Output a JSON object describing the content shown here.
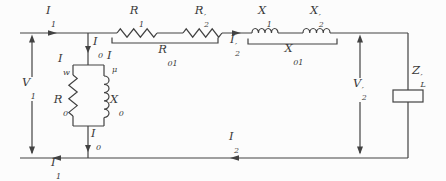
{
  "diagram": {
    "kind": "transformer-equivalent-circuit",
    "colors": {
      "background": "#fcfcfc",
      "stroke": "#424242",
      "text": "#3a3a3a"
    },
    "labels": {
      "i1_top": {
        "base": "I",
        "prime": "",
        "sub": "1"
      },
      "r1": {
        "base": "R",
        "prime": "",
        "sub": "1"
      },
      "r2_prime": {
        "base": "R",
        "prime": "′",
        "sub": "2"
      },
      "x1": {
        "base": "X",
        "prime": "",
        "sub": "1"
      },
      "x2_prime": {
        "base": "X",
        "prime": "′",
        "sub": "2"
      },
      "r01": {
        "base": "R",
        "prime": "",
        "sub": "01"
      },
      "x01": {
        "base": "X",
        "prime": "",
        "sub": "01"
      },
      "i2_prime": {
        "base": "I",
        "prime": "′",
        "sub": "2"
      },
      "i0_top": {
        "base": "I",
        "prime": "",
        "sub": "0"
      },
      "iw": {
        "base": "I",
        "prime": "",
        "sub": "w"
      },
      "imu": {
        "base": "I",
        "prime": "",
        "sub": "μ"
      },
      "r0": {
        "base": "R",
        "prime": "",
        "sub": "0"
      },
      "x0": {
        "base": "X",
        "prime": "",
        "sub": "0"
      },
      "v1": {
        "base": "V",
        "prime": "",
        "sub": "1"
      },
      "v2_prime": {
        "base": "V",
        "prime": "′",
        "sub": "2"
      },
      "zl_prime": {
        "base": "Z",
        "prime": "′",
        "sub": "L"
      },
      "i0_bot": {
        "base": "I",
        "prime": "",
        "sub": "0"
      },
      "i2_bot": {
        "base": "I",
        "prime": "",
        "sub": "2"
      },
      "i1_bot": {
        "base": "I",
        "prime": "",
        "sub": "1"
      }
    }
  }
}
